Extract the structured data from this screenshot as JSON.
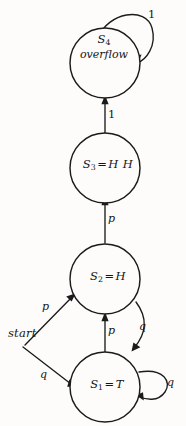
{
  "figure": {
    "kind": "finite-state-machine-diagram",
    "background_color": "#fdfcfb",
    "ink_color": "#1b1b1b"
  },
  "start": {
    "label": "start",
    "transitions": [
      {
        "label": "p",
        "target": "S2"
      },
      {
        "label": "q",
        "target": "S1"
      }
    ]
  },
  "states": [
    {
      "id": "S4",
      "name": "S",
      "subscript": "4",
      "sublabel": "overflow",
      "has_equals": false,
      "value": ""
    },
    {
      "id": "S3",
      "name": "S",
      "subscript": "3",
      "equals": "=",
      "value": "H H",
      "has_equals": true,
      "sublabel": ""
    },
    {
      "id": "S2",
      "name": "S",
      "subscript": "2",
      "equals": "=",
      "value": "H",
      "has_equals": true,
      "sublabel": ""
    },
    {
      "id": "S1",
      "name": "S",
      "subscript": "1",
      "equals": "=",
      "value": "T",
      "has_equals": true,
      "sublabel": ""
    }
  ],
  "edges": [
    {
      "id": "s4-self-loop",
      "from": "S4",
      "to": "S4",
      "label": "1"
    },
    {
      "id": "s3-to-s4",
      "from": "S3",
      "to": "S4",
      "label": "1"
    },
    {
      "id": "s2-to-s3",
      "from": "S2",
      "to": "S3",
      "label": "p"
    },
    {
      "id": "s1-to-s2",
      "from": "S1",
      "to": "S2",
      "label": "p"
    },
    {
      "id": "s2-to-s1",
      "from": "S2",
      "to": "S1",
      "label": "q"
    },
    {
      "id": "s1-self-loop",
      "from": "S1",
      "to": "S1",
      "label": "q"
    },
    {
      "id": "start-to-s2",
      "from": "start",
      "to": "S2",
      "label": "p"
    },
    {
      "id": "start-to-s1",
      "from": "start",
      "to": "S1",
      "label": "q"
    }
  ]
}
